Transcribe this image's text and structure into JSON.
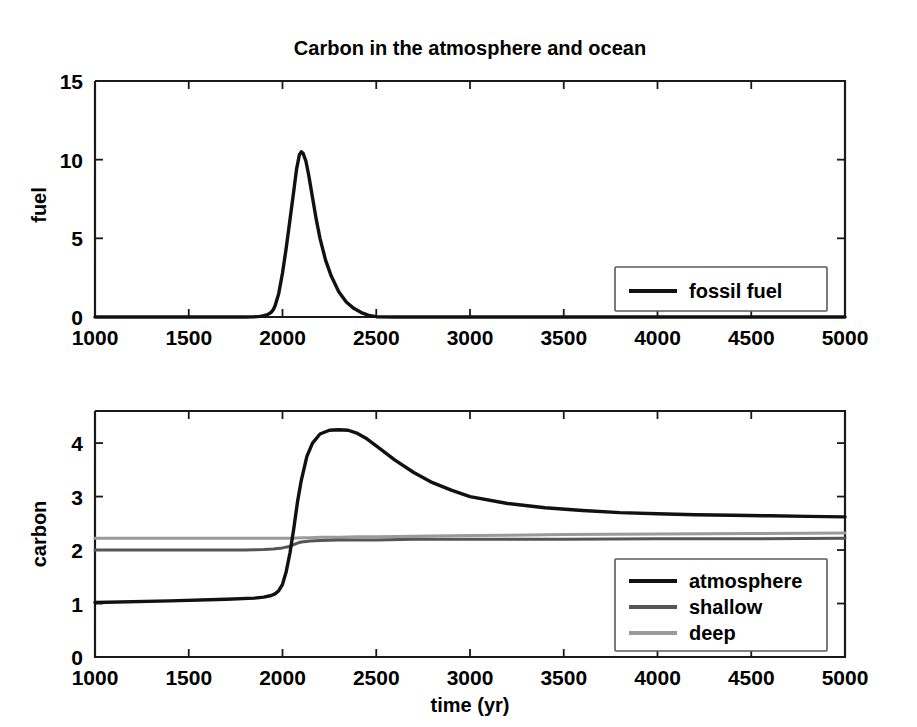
{
  "figure": {
    "title": "Carbon in the atmosphere and ocean",
    "xlabel": "time (yr)",
    "background": "#ffffff"
  },
  "colors": {
    "atmosphere": "#111111",
    "fossil_fuel": "#111111",
    "shallow": "#555555",
    "deep": "#9a9a9a",
    "axis": "#1a1a1a"
  },
  "panels": {
    "top": {
      "ylabel": "fuel",
      "yticks": [
        "0",
        "5",
        "10",
        "15"
      ],
      "xticks": [
        "1000",
        "1500",
        "2000",
        "2500",
        "3000",
        "3500",
        "4000",
        "4500",
        "5000"
      ],
      "legend": {
        "items": [
          {
            "label": "fossil fuel",
            "color_key": "fossil_fuel"
          }
        ]
      }
    },
    "bottom": {
      "ylabel": "carbon",
      "yticks": [
        "0",
        "1",
        "2",
        "3",
        "4"
      ],
      "xticks": [
        "1000",
        "1500",
        "2000",
        "2500",
        "3000",
        "3500",
        "4000",
        "4500",
        "5000"
      ],
      "legend": {
        "items": [
          {
            "label": "atmosphere",
            "color_key": "atmosphere"
          },
          {
            "label": "shallow",
            "color_key": "shallow"
          },
          {
            "label": "deep",
            "color_key": "deep"
          }
        ]
      }
    }
  },
  "chart_data": [
    {
      "type": "line",
      "panel": "top",
      "title": "Carbon in the atmosphere and ocean",
      "xlabel": "",
      "ylabel": "fuel",
      "xlim": [
        1000,
        5000
      ],
      "ylim": [
        0,
        15
      ],
      "xticks": [
        1000,
        1500,
        2000,
        2500,
        3000,
        3500,
        4000,
        4500,
        5000
      ],
      "yticks": [
        0,
        5,
        10,
        15
      ],
      "grid": false,
      "legend_position": "lower right",
      "series": [
        {
          "name": "fossil fuel",
          "color": "#111111",
          "x": [
            1000,
            1200,
            1400,
            1600,
            1700,
            1800,
            1850,
            1880,
            1900,
            1920,
            1940,
            1950,
            1960,
            1980,
            2000,
            2020,
            2040,
            2060,
            2075,
            2090,
            2100,
            2110,
            2125,
            2140,
            2160,
            2180,
            2200,
            2230,
            2260,
            2300,
            2340,
            2380,
            2420,
            2460,
            2500,
            2600,
            2800,
            3000,
            3500,
            4000,
            4500,
            5000
          ],
          "values": [
            0,
            0,
            0,
            0,
            0,
            0,
            0.02,
            0.04,
            0.08,
            0.15,
            0.3,
            0.45,
            0.7,
            1.5,
            2.8,
            4.4,
            6.2,
            8.0,
            9.4,
            10.3,
            10.5,
            10.4,
            9.9,
            9.0,
            7.6,
            6.2,
            5.0,
            3.6,
            2.6,
            1.6,
            0.95,
            0.55,
            0.28,
            0.1,
            0.02,
            0,
            0,
            0,
            0,
            0,
            0,
            0
          ]
        }
      ]
    },
    {
      "type": "line",
      "panel": "bottom",
      "title": "",
      "xlabel": "time (yr)",
      "ylabel": "carbon",
      "xlim": [
        1000,
        5000
      ],
      "ylim": [
        0,
        4.6
      ],
      "xticks": [
        1000,
        1500,
        2000,
        2500,
        3000,
        3500,
        4000,
        4500,
        5000
      ],
      "yticks": [
        0,
        1,
        2,
        3,
        4
      ],
      "grid": false,
      "legend_position": "lower right",
      "series": [
        {
          "name": "atmosphere",
          "color": "#111111",
          "x": [
            1000,
            1400,
            1700,
            1850,
            1900,
            1940,
            1960,
            1980,
            2000,
            2020,
            2040,
            2060,
            2080,
            2100,
            2130,
            2160,
            2200,
            2250,
            2300,
            2350,
            2400,
            2450,
            2500,
            2600,
            2700,
            2800,
            2900,
            3000,
            3200,
            3400,
            3600,
            3800,
            4000,
            4200,
            4400,
            4600,
            4800,
            5000
          ],
          "values": [
            1.02,
            1.05,
            1.08,
            1.1,
            1.12,
            1.15,
            1.18,
            1.24,
            1.36,
            1.6,
            1.95,
            2.4,
            2.9,
            3.3,
            3.75,
            4.0,
            4.17,
            4.24,
            4.25,
            4.24,
            4.18,
            4.08,
            3.95,
            3.68,
            3.45,
            3.26,
            3.12,
            3.0,
            2.87,
            2.79,
            2.74,
            2.7,
            2.68,
            2.66,
            2.65,
            2.64,
            2.63,
            2.62
          ]
        },
        {
          "name": "shallow",
          "color": "#555555",
          "x": [
            1000,
            1500,
            1800,
            1900,
            1950,
            2000,
            2030,
            2060,
            2080,
            2100,
            2150,
            2200,
            2300,
            2400,
            2500,
            2700,
            3000,
            3500,
            4000,
            4500,
            5000
          ],
          "values": [
            2.0,
            2.0,
            2.0,
            2.01,
            2.02,
            2.04,
            2.06,
            2.1,
            2.13,
            2.15,
            2.17,
            2.18,
            2.19,
            2.19,
            2.19,
            2.2,
            2.2,
            2.2,
            2.21,
            2.21,
            2.22
          ]
        },
        {
          "name": "deep",
          "color": "#9a9a9a",
          "x": [
            1000,
            1500,
            1800,
            1900,
            1950,
            2000,
            2050,
            2100,
            2150,
            2200,
            2300,
            2400,
            2500,
            2700,
            3000,
            3500,
            4000,
            4500,
            5000
          ],
          "values": [
            2.22,
            2.22,
            2.22,
            2.22,
            2.22,
            2.22,
            2.22,
            2.23,
            2.23,
            2.24,
            2.24,
            2.25,
            2.25,
            2.26,
            2.27,
            2.29,
            2.3,
            2.31,
            2.32
          ]
        }
      ]
    }
  ]
}
